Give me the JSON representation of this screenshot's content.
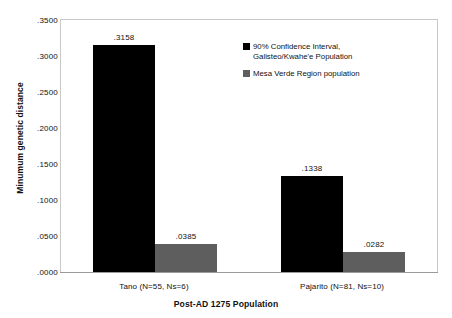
{
  "chart_data": {
    "type": "bar",
    "title": "",
    "xlabel": "Post-AD 1275 Population",
    "ylabel": "Minumum genetic distance",
    "ylim": [
      0.0,
      0.35
    ],
    "yticks": [
      ".0000",
      ".0500",
      ".1000",
      ".1500",
      ".2000",
      ".2500",
      ".3000",
      ".3500"
    ],
    "ytick_values": [
      0.0,
      0.05,
      0.1,
      0.15,
      0.2,
      0.25,
      0.3,
      0.35
    ],
    "grid": false,
    "legend_position": "upper-right-inside",
    "categories": [
      "Tano (N=55, Ns=6)",
      "Pajarito (N=81, Ns=10)"
    ],
    "series": [
      {
        "name": "90% Confidence Interval, Galisteo/Kwahe'e Population",
        "color": "#000000",
        "values": [
          0.3158,
          0.1338
        ],
        "labels": [
          ".3158",
          ".1338"
        ]
      },
      {
        "name": "Mesa Verde Region population",
        "color": "#5E5E5E",
        "values": [
          0.0385,
          0.0282
        ],
        "labels": [
          ".0385",
          ".0282"
        ]
      }
    ]
  },
  "legend": {
    "items": [
      {
        "label_line1": "90% Confidence Interval,",
        "label_line2": "Galisteo/Kwahe'e Population",
        "color": "#000000"
      },
      {
        "label_line1": "Mesa Verde Region population",
        "label_line2": "",
        "color": "#5E5E5E"
      }
    ]
  },
  "axes": {
    "y_title": "Minumum genetic distance",
    "x_title": "Post-AD 1275 Population"
  }
}
